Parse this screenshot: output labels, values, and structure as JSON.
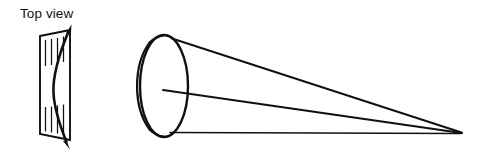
{
  "figure": {
    "title_visible": false,
    "background_color": "#ffffff",
    "ink_color": "#111111",
    "style": "line-art-technical-diagram"
  },
  "labels": {
    "top_view": "Top view"
  },
  "top_view_inset": {
    "name": "hatched-panel",
    "description": "slanted rectangular panel with vertical hatch lines and a curved double-headed arrow through it",
    "panel_corners": [
      [
        40,
        36
      ],
      [
        70,
        30
      ],
      [
        70,
        140
      ],
      [
        40,
        134
      ]
    ],
    "hatch_lines_top": [
      [
        46,
        40,
        46,
        66
      ],
      [
        52,
        39,
        52,
        65
      ],
      [
        58,
        38,
        58,
        64
      ],
      [
        64,
        36,
        64,
        62
      ]
    ],
    "hatch_lines_bottom": [
      [
        46,
        106,
        46,
        131
      ],
      [
        52,
        106,
        52,
        132
      ],
      [
        58,
        105,
        58,
        133
      ],
      [
        64,
        104,
        64,
        134
      ]
    ],
    "curve_arrow": {
      "double_headed": true,
      "start": [
        70,
        26
      ],
      "end": [
        68,
        147
      ],
      "bow_direction": "left"
    }
  },
  "cone_diagram": {
    "name": "diverging-beam-cone",
    "disc": {
      "center": [
        164,
        86
      ],
      "radius_x": 24,
      "radius_y": 51,
      "rim_layers": 5,
      "rim_side": "left"
    },
    "apex": [
      462,
      133
    ],
    "rays": [
      {
        "name": "upper-ray",
        "from": [
          172,
          38
        ],
        "to": [
          462,
          133
        ]
      },
      {
        "name": "center-ray",
        "from": [
          163,
          90
        ],
        "to": [
          462,
          133
        ]
      },
      {
        "name": "lower-ray",
        "from": [
          170,
          132
        ],
        "to": [
          462,
          133
        ]
      }
    ]
  }
}
